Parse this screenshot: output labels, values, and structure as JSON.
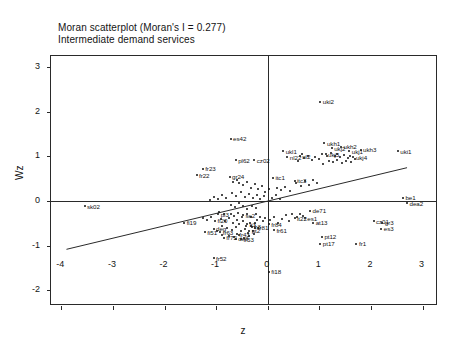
{
  "chart_data": {
    "type": "scatter",
    "title": "Moran scatterplot (Moran's I = 0.277)",
    "subtitle": "Intermediate demand services",
    "xlabel": "z",
    "ylabel": "Wz",
    "xlim": [
      -4.2,
      3.3
    ],
    "ylim": [
      -2.35,
      3.25
    ],
    "xticks": [
      -4,
      -3,
      -2,
      -1,
      0,
      1,
      2,
      3
    ],
    "yticks": [
      -2,
      -1,
      0,
      1,
      2,
      3
    ],
    "grid": false,
    "legend": "none",
    "morans_i": 0.277,
    "reference_lines": {
      "vertical_x": 0,
      "horizontal_y": 0
    },
    "regression_line": {
      "slope": 0.277,
      "intercept": 0.0,
      "x_start": -3.9,
      "x_end": 2.7
    },
    "point_color": "#111111",
    "label_color": "#111111",
    "points": [
      {
        "label": "uki2",
        "x": 1.02,
        "y": 2.22
      },
      {
        "label": "uki1",
        "x": 2.52,
        "y": 1.12
      },
      {
        "label": "ukh1",
        "x": 1.1,
        "y": 1.3
      },
      {
        "label": "ukh2",
        "x": 1.42,
        "y": 1.22
      },
      {
        "label": "ukh3",
        "x": 1.8,
        "y": 1.15
      },
      {
        "label": "ukj1",
        "x": 1.58,
        "y": 1.12
      },
      {
        "label": "ukj2",
        "x": 1.24,
        "y": 1.18
      },
      {
        "label": "ukj3",
        "x": 1.12,
        "y": 1.05
      },
      {
        "label": "ukj4",
        "x": 1.66,
        "y": 0.98
      },
      {
        "label": "ukl1",
        "x": 0.3,
        "y": 1.12
      },
      {
        "label": "nl22",
        "x": 0.38,
        "y": 0.98
      },
      {
        "label": "nl2",
        "x": 0.62,
        "y": 1.0
      },
      {
        "label": "es42",
        "x": -0.72,
        "y": 1.4
      },
      {
        "label": "pl62",
        "x": -0.62,
        "y": 0.92
      },
      {
        "label": "cz02",
        "x": -0.26,
        "y": 0.92
      },
      {
        "label": "fr23",
        "x": -1.26,
        "y": 0.72
      },
      {
        "label": "fr22",
        "x": -1.38,
        "y": 0.58
      },
      {
        "label": "gr24",
        "x": -0.74,
        "y": 0.55
      },
      {
        "label": "itc1",
        "x": 0.1,
        "y": 0.52
      },
      {
        "label": "itc3",
        "x": 0.52,
        "y": 0.46
      },
      {
        "label": "be1",
        "x": 2.62,
        "y": 0.08
      },
      {
        "label": "dea2",
        "x": 2.7,
        "y": -0.05
      },
      {
        "label": "sk02",
        "x": -3.55,
        "y": -0.12
      },
      {
        "label": "de71",
        "x": 0.82,
        "y": -0.22
      },
      {
        "label": "at13",
        "x": 0.88,
        "y": -0.48
      },
      {
        "label": "cz01",
        "x": 2.05,
        "y": -0.45
      },
      {
        "label": "gr3",
        "x": 2.22,
        "y": -0.48
      },
      {
        "label": "es3",
        "x": 2.2,
        "y": -0.62
      },
      {
        "label": "pt12",
        "x": 1.05,
        "y": -0.8
      },
      {
        "label": "pt17",
        "x": 1.02,
        "y": -0.95
      },
      {
        "label": "fr1",
        "x": 1.72,
        "y": -0.95
      },
      {
        "label": "fr61",
        "x": 0.12,
        "y": -0.65
      },
      {
        "label": "it22",
        "x": 0.52,
        "y": -0.38
      },
      {
        "label": "fi19",
        "x": -1.62,
        "y": -0.48
      },
      {
        "label": "fi20",
        "x": -1.02,
        "y": -0.44
      },
      {
        "label": "pl3",
        "x": -0.96,
        "y": -0.3
      },
      {
        "label": "deg",
        "x": -1.05,
        "y": -0.62
      },
      {
        "label": "fi51",
        "x": -1.22,
        "y": -0.7
      },
      {
        "label": "fr63",
        "x": -0.92,
        "y": -0.7
      },
      {
        "label": "fr43",
        "x": -0.6,
        "y": -0.74
      },
      {
        "label": "fr72",
        "x": -0.85,
        "y": -0.82
      },
      {
        "label": "de8",
        "x": -0.62,
        "y": -0.84
      },
      {
        "label": "fr53",
        "x": -0.52,
        "y": -0.86
      },
      {
        "label": "fr52",
        "x": -1.05,
        "y": -1.28
      },
      {
        "label": "fi18",
        "x": 0.02,
        "y": -1.58
      },
      {
        "label": "fr81",
        "x": -0.24,
        "y": -0.6
      },
      {
        "label": "fr84",
        "x": 0.02,
        "y": -0.52
      },
      {
        "label": "es1",
        "x": 0.72,
        "y": -0.38
      },
      {
        "label": "se2",
        "x": -0.48,
        "y": -0.32
      },
      {
        "label": "it3",
        "x": -0.4,
        "y": -0.52
      },
      {
        "label": "fr3",
        "x": -0.32,
        "y": -0.56
      },
      {
        "label": "pt2",
        "x": -0.36,
        "y": -0.66
      }
    ],
    "cluster_points": [
      {
        "x": 1.05,
        "y": 1.05
      },
      {
        "x": 1.15,
        "y": 1.02
      },
      {
        "x": 1.22,
        "y": 1.08
      },
      {
        "x": 1.3,
        "y": 1.0
      },
      {
        "x": 1.35,
        "y": 1.06
      },
      {
        "x": 1.4,
        "y": 0.98
      },
      {
        "x": 1.48,
        "y": 1.03
      },
      {
        "x": 1.55,
        "y": 0.96
      },
      {
        "x": 1.6,
        "y": 1.01
      },
      {
        "x": 1.0,
        "y": 0.95
      },
      {
        "x": 0.92,
        "y": 0.99
      },
      {
        "x": 0.85,
        "y": 0.92
      },
      {
        "x": 1.18,
        "y": 0.9
      },
      {
        "x": 1.26,
        "y": 0.88
      },
      {
        "x": 1.34,
        "y": 0.92
      },
      {
        "x": 1.44,
        "y": 0.86
      },
      {
        "x": 1.52,
        "y": 0.9
      },
      {
        "x": 0.78,
        "y": 1.02
      },
      {
        "x": 0.7,
        "y": 0.96
      },
      {
        "x": 0.66,
        "y": 1.05
      },
      {
        "x": 0.58,
        "y": 0.9
      },
      {
        "x": 1.62,
        "y": 0.88
      },
      {
        "x": 1.7,
        "y": 0.94
      },
      {
        "x": 1.08,
        "y": 0.84
      },
      {
        "x": -0.9,
        "y": -0.4
      },
      {
        "x": -0.82,
        "y": -0.45
      },
      {
        "x": -0.75,
        "y": -0.38
      },
      {
        "x": -0.68,
        "y": -0.48
      },
      {
        "x": -0.6,
        "y": -0.42
      },
      {
        "x": -0.55,
        "y": -0.52
      },
      {
        "x": -0.48,
        "y": -0.45
      },
      {
        "x": -0.42,
        "y": -0.55
      },
      {
        "x": -0.35,
        "y": -0.48
      },
      {
        "x": -0.3,
        "y": -0.58
      },
      {
        "x": -0.25,
        "y": -0.5
      },
      {
        "x": -0.2,
        "y": -0.42
      },
      {
        "x": -0.88,
        "y": -0.55
      },
      {
        "x": -0.78,
        "y": -0.6
      },
      {
        "x": -0.7,
        "y": -0.65
      },
      {
        "x": -0.62,
        "y": -0.58
      },
      {
        "x": -0.52,
        "y": -0.68
      },
      {
        "x": -0.45,
        "y": -0.62
      },
      {
        "x": -0.38,
        "y": -0.72
      },
      {
        "x": -0.28,
        "y": -0.66
      },
      {
        "x": -0.18,
        "y": -0.6
      },
      {
        "x": -0.95,
        "y": -0.25
      },
      {
        "x": -0.85,
        "y": -0.3
      },
      {
        "x": -0.72,
        "y": -0.28
      },
      {
        "x": -0.65,
        "y": -0.33
      },
      {
        "x": -0.58,
        "y": -0.26
      },
      {
        "x": -0.5,
        "y": -0.35
      },
      {
        "x": -0.4,
        "y": -0.3
      },
      {
        "x": -0.32,
        "y": -0.36
      },
      {
        "x": -0.22,
        "y": -0.28
      },
      {
        "x": -0.15,
        "y": -0.35
      },
      {
        "x": -0.1,
        "y": -0.45
      },
      {
        "x": -0.05,
        "y": -0.38
      },
      {
        "x": 0.05,
        "y": -0.42
      },
      {
        "x": 0.12,
        "y": -0.35
      },
      {
        "x": 0.2,
        "y": -0.48
      },
      {
        "x": 0.28,
        "y": -0.4
      },
      {
        "x": 0.35,
        "y": -0.32
      },
      {
        "x": 0.42,
        "y": -0.44
      },
      {
        "x": -1.1,
        "y": -0.35
      },
      {
        "x": -1.18,
        "y": -0.42
      },
      {
        "x": -1.25,
        "y": -0.38
      },
      {
        "x": -0.98,
        "y": -0.68
      },
      {
        "x": -0.88,
        "y": -0.75
      },
      {
        "x": -0.76,
        "y": -0.78
      },
      {
        "x": -0.66,
        "y": -0.8
      },
      {
        "x": -0.56,
        "y": -0.76
      },
      {
        "x": -0.46,
        "y": -0.82
      },
      {
        "x": -0.36,
        "y": -0.78
      },
      {
        "x": -0.26,
        "y": -0.74
      },
      {
        "x": 0.48,
        "y": -0.3
      },
      {
        "x": 0.56,
        "y": -0.36
      },
      {
        "x": 0.62,
        "y": -0.28
      },
      {
        "x": 0.68,
        "y": -0.34
      },
      {
        "x": -0.55,
        "y": 0.4
      },
      {
        "x": -0.48,
        "y": 0.35
      },
      {
        "x": -0.4,
        "y": 0.42
      },
      {
        "x": -0.32,
        "y": 0.3
      },
      {
        "x": -0.25,
        "y": 0.38
      },
      {
        "x": -0.18,
        "y": 0.28
      },
      {
        "x": -0.6,
        "y": 0.48
      },
      {
        "x": -0.68,
        "y": 0.42
      },
      {
        "x": -0.12,
        "y": 0.34
      },
      {
        "x": 0.18,
        "y": 0.3
      },
      {
        "x": 0.26,
        "y": 0.24
      },
      {
        "x": 0.34,
        "y": 0.32
      },
      {
        "x": 0.44,
        "y": 0.22
      },
      {
        "x": -0.05,
        "y": 0.2
      },
      {
        "x": 0.02,
        "y": 0.26
      },
      {
        "x": -0.7,
        "y": 0.18
      },
      {
        "x": -0.62,
        "y": 0.12
      },
      {
        "x": -0.52,
        "y": 0.2
      },
      {
        "x": -0.44,
        "y": 0.1
      },
      {
        "x": -0.36,
        "y": 0.16
      },
      {
        "x": -0.28,
        "y": 0.08
      },
      {
        "x": -0.2,
        "y": 0.14
      },
      {
        "x": -0.14,
        "y": 0.05
      },
      {
        "x": -0.08,
        "y": 0.12
      },
      {
        "x": 0.08,
        "y": 0.08
      },
      {
        "x": 0.16,
        "y": 0.14
      },
      {
        "x": 0.24,
        "y": 0.05
      },
      {
        "x": -0.8,
        "y": 0.08
      },
      {
        "x": -0.88,
        "y": 0.14
      },
      {
        "x": -0.96,
        "y": 0.05
      },
      {
        "x": -1.04,
        "y": 0.1
      },
      {
        "x": -1.12,
        "y": 0.02
      },
      {
        "x": -0.72,
        "y": -0.08
      },
      {
        "x": -0.64,
        "y": -0.14
      },
      {
        "x": -0.56,
        "y": -0.05
      },
      {
        "x": -0.48,
        "y": -0.12
      },
      {
        "x": -0.4,
        "y": -0.18
      },
      {
        "x": -0.3,
        "y": -0.1
      },
      {
        "x": -0.22,
        "y": -0.16
      },
      {
        "x": 0.55,
        "y": 0.4
      },
      {
        "x": 0.64,
        "y": 0.34
      },
      {
        "x": 0.72,
        "y": 0.44
      },
      {
        "x": 0.8,
        "y": 0.36
      },
      {
        "x": 0.88,
        "y": 0.48
      },
      {
        "x": 0.96,
        "y": 0.4
      }
    ]
  }
}
